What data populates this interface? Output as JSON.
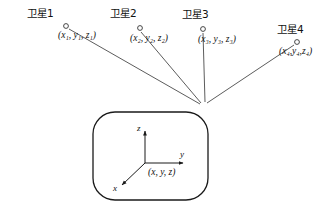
{
  "figure": {
    "type": "diagram",
    "background_color": "#ffffff",
    "stroke_color": "#333333"
  },
  "satellites": [
    {
      "name": "卫星1",
      "coord_label": "(x₁, y₁, z₁)",
      "coord_base": "(x",
      "marker": "open-circle",
      "marker_x": 66,
      "marker_y": 26,
      "name_x": 27,
      "name_y": 10,
      "coord_x": 58,
      "coord_y": 31
    },
    {
      "name": "卫星2",
      "coord_label": "(x₂, y₂, z₂)",
      "marker": "open-circle",
      "marker_x": 140,
      "marker_y": 28,
      "name_x": 110,
      "name_y": 10,
      "coord_x": 130,
      "coord_y": 34
    },
    {
      "name": "卫星3",
      "coord_label": "(x₃, y₃, z₃)",
      "marker": "open-circle",
      "marker_x": 203,
      "marker_y": 29,
      "name_x": 182,
      "name_y": 11,
      "coord_x": 198,
      "coord_y": 35
    },
    {
      "name": "卫星4",
      "coord_label": "(x₄,y₄,z₄)",
      "marker": "open-circle",
      "marker_x": 297,
      "marker_y": 42,
      "name_x": 277,
      "name_y": 26,
      "coord_x": 281,
      "coord_y": 48
    }
  ],
  "receiver": {
    "convergence_x": 203,
    "convergence_y": 106,
    "body_shape": "rounded-rectangle",
    "body_x": 93,
    "body_y": 112,
    "body_width": 115,
    "body_height": 88,
    "body_radius": 22,
    "origin_label": "(x, y, z)",
    "axes": [
      {
        "name": "z",
        "label": "z",
        "direction": "up"
      },
      {
        "name": "y",
        "label": "y",
        "direction": "right"
      },
      {
        "name": "x",
        "label": "x",
        "direction": "down-left"
      }
    ]
  }
}
